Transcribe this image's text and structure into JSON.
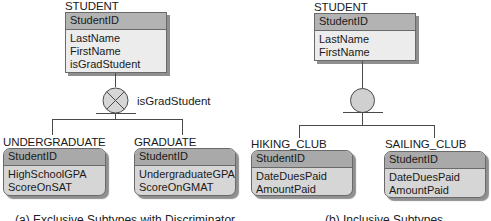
{
  "diagram_a": {
    "supertype": {
      "name": "STUDENT",
      "key": "StudentID",
      "attributes": [
        "LastName",
        "FirstName",
        "isGradStudent"
      ]
    },
    "symbol": "exclusive-circle-with-x",
    "discriminator": "isGradStudent",
    "subtypes": [
      {
        "name": "UNDERGRADUATE",
        "key": "StudentID",
        "attributes": [
          "HighSchoolGPA",
          "ScoreOnSAT"
        ]
      },
      {
        "name": "GRADUATE",
        "key": "StudentID",
        "attributes": [
          "UndergraduateGPA",
          "ScoreOnGMAT"
        ]
      }
    ],
    "caption": "(a) Exclusive Subtypes with Discriminator"
  },
  "diagram_b": {
    "supertype": {
      "name": "STUDENT",
      "key": "StudentID",
      "attributes": [
        "LastName",
        "FirstName"
      ]
    },
    "symbol": "inclusive-circle",
    "subtypes": [
      {
        "name": "HIKING_CLUB",
        "key": "StudentID",
        "attributes": [
          "DateDuesPaid",
          "AmountPaid"
        ]
      },
      {
        "name": "SAILING_CLUB",
        "key": "StudentID",
        "attributes": [
          "DateDuesPaid",
          "AmountPaid"
        ]
      }
    ],
    "caption": "(b) Inclusive Subtypes"
  },
  "colors": {
    "header_fill": "#b3b3b3",
    "body_fill": "#ececec",
    "subtype_header_fill": "#a9a9a9",
    "subtype_body_fill": "#d6d6d6",
    "line": "#4a4a4a",
    "inclusive_circle_fill": "#d0d0d0"
  }
}
